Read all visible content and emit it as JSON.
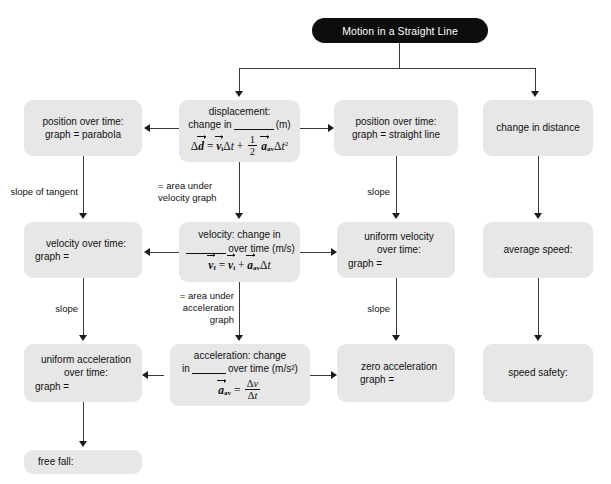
{
  "diagram": {
    "title": "Motion in a Straight Line",
    "boxes": {
      "position_parabola": {
        "line1": "position over time:",
        "line2": "graph = parabola"
      },
      "displacement": {
        "line1": "displacement:",
        "line2_pre": "change in",
        "line2_post": "(m)",
        "formula": "Δd = vᵢΔt + ½ aₐᵥΔt²"
      },
      "position_straight": {
        "line1": "position over time:",
        "line2": "graph = straight line"
      },
      "change_distance": {
        "line1": "change in distance"
      },
      "velocity_graph": {
        "line1": "velocity over time:",
        "line2": "graph ="
      },
      "velocity": {
        "line1": "velocity: change in",
        "line2_post": "over time (m/s)",
        "formula": "v_f = vᵢ + aₐᵥΔt"
      },
      "uniform_velocity": {
        "line1": "uniform velocity",
        "line2": "over time:",
        "line3": "graph ="
      },
      "average_speed": {
        "line1": "average speed:"
      },
      "uniform_acceleration": {
        "line1": "uniform acceleration",
        "line2": "over time:",
        "line3": "graph ="
      },
      "acceleration": {
        "line1": "acceleration: change",
        "line2_pre": "in",
        "line2_post": "over time (m/s²)",
        "formula": "aₐᵥ = Δv / Δt"
      },
      "zero_acceleration": {
        "line1": "zero acceleration",
        "line2": "graph ="
      },
      "speed_safety": {
        "line1": "speed safety:"
      },
      "free_fall": {
        "line1": "free fall:"
      }
    },
    "edge_labels": {
      "slope_of_tangent": "slope of tangent",
      "area_under_velocity_1": "= area under",
      "area_under_velocity_2": "velocity graph",
      "slope_col3_r2": "slope",
      "slope_col1_r3": "slope",
      "area_under_accel_1": "= area under",
      "area_under_accel_2": "acceleration",
      "area_under_accel_3": "graph",
      "slope_col3_r3": "slope"
    },
    "colors": {
      "title_background": "#0d0d0d",
      "title_text": "#ffffff",
      "box_background": "#e7e7e7",
      "box_text": "#111111",
      "connector": "#3a3a3a",
      "page_background": "#ffffff"
    }
  }
}
